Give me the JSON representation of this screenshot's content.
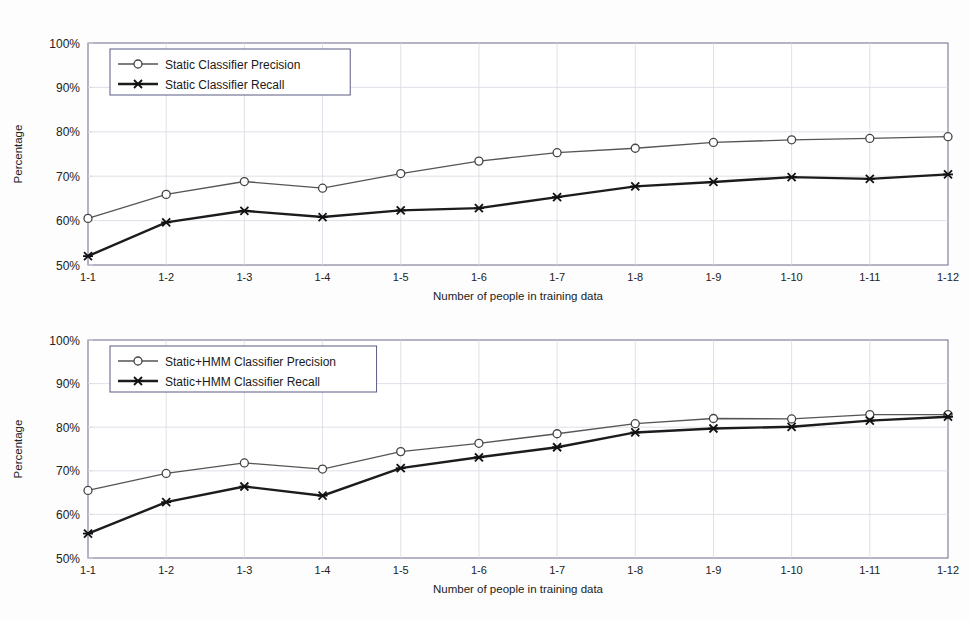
{
  "figure": {
    "background": "#fdfdfd",
    "panels": 2
  },
  "chart_data": [
    {
      "id": "static-classifier",
      "type": "line",
      "title": "",
      "xlabel": "Number of people in training data",
      "ylabel": "Percentage",
      "categories": [
        "1-1",
        "1-2",
        "1-3",
        "1-4",
        "1-5",
        "1-6",
        "1-7",
        "1-8",
        "1-9",
        "1-10",
        "1-11",
        "1-12"
      ],
      "ylim": [
        50,
        100
      ],
      "yticks": [
        50,
        60,
        70,
        80,
        90,
        100
      ],
      "ytick_labels": [
        "50%",
        "60%",
        "70%",
        "80%",
        "90%",
        "100%"
      ],
      "grid": true,
      "legend_position": "top-left",
      "series": [
        {
          "name": "Static Classifier Precision",
          "marker": "circle",
          "color": "#555555",
          "values": [
            60.5,
            65.9,
            68.8,
            67.3,
            70.6,
            73.4,
            75.3,
            76.3,
            77.6,
            78.2,
            78.5,
            78.9
          ]
        },
        {
          "name": "Static Classifier Recall",
          "marker": "cross",
          "color": "#1c1c1c",
          "values": [
            52.0,
            59.6,
            62.2,
            60.8,
            62.3,
            62.8,
            65.3,
            67.7,
            68.7,
            69.8,
            69.4,
            70.4
          ]
        }
      ]
    },
    {
      "id": "static-hmm-classifier",
      "type": "line",
      "title": "",
      "xlabel": "Number of people in training data",
      "ylabel": "Percentage",
      "categories": [
        "1-1",
        "1-2",
        "1-3",
        "1-4",
        "1-5",
        "1-6",
        "1-7",
        "1-8",
        "1-9",
        "1-10",
        "1-11",
        "1-12"
      ],
      "ylim": [
        50,
        100
      ],
      "yticks": [
        50,
        60,
        70,
        80,
        90,
        100
      ],
      "ytick_labels": [
        "50%",
        "60%",
        "70%",
        "80%",
        "90%",
        "100%"
      ],
      "grid": true,
      "legend_position": "top-left",
      "series": [
        {
          "name": "Static+HMM Classifier Precision",
          "marker": "circle",
          "color": "#555555",
          "values": [
            65.5,
            69.4,
            71.8,
            70.4,
            74.4,
            76.3,
            78.5,
            80.8,
            82.0,
            81.9,
            82.9,
            82.9
          ]
        },
        {
          "name": "Static+HMM Classifier Recall",
          "marker": "cross",
          "color": "#1c1c1c",
          "values": [
            55.6,
            62.8,
            66.4,
            64.3,
            70.6,
            73.1,
            75.4,
            78.8,
            79.7,
            80.1,
            81.5,
            82.4
          ]
        }
      ]
    }
  ]
}
